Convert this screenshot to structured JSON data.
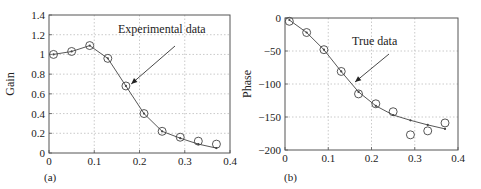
{
  "chart_data": [
    {
      "type": "line",
      "panel_label": "(a)",
      "title": "",
      "xlabel": "",
      "ylabel": "Gain",
      "xlim": [
        0,
        0.4
      ],
      "ylim": [
        0,
        1.4
      ],
      "x_ticks": [
        "0",
        "0.1",
        "0.2",
        "0.3",
        "0.4"
      ],
      "y_ticks": [
        "0",
        "0.2",
        "0.4",
        "0.6",
        "0.8",
        "1",
        "1.2",
        "1.4"
      ],
      "grid": true,
      "annotation": {
        "text": "Experimental data",
        "arrow_to": [
          0.175,
          0.68
        ]
      },
      "x": [
        0.01,
        0.05,
        0.09,
        0.13,
        0.17,
        0.21,
        0.25,
        0.29,
        0.33,
        0.37
      ],
      "series": [
        {
          "name": "Experimental data",
          "style": "circles",
          "values": [
            1.0,
            1.03,
            1.09,
            0.96,
            0.68,
            0.4,
            0.22,
            0.16,
            0.12,
            0.09
          ]
        },
        {
          "name": "Model",
          "style": "line",
          "values": [
            1.0,
            1.03,
            1.09,
            0.96,
            0.68,
            0.4,
            0.22,
            0.15,
            0.09,
            0.05
          ]
        }
      ]
    },
    {
      "type": "line",
      "panel_label": "(b)",
      "title": "",
      "xlabel": "",
      "ylabel": "Phase",
      "xlim": [
        0,
        0.4
      ],
      "ylim": [
        -200,
        0
      ],
      "x_ticks": [
        "0",
        "0.1",
        "0.2",
        "0.3",
        "0.4"
      ],
      "y_ticks": [
        "0",
        "-50",
        "-100",
        "-150",
        "-200"
      ],
      "grid": true,
      "annotation": {
        "text": "True data",
        "arrow_to": [
          0.155,
          -100
        ]
      },
      "x": [
        0.01,
        0.05,
        0.09,
        0.13,
        0.17,
        0.21,
        0.25,
        0.29,
        0.33,
        0.37
      ],
      "series": [
        {
          "name": "Measured",
          "style": "circles",
          "values": [
            -5,
            -22,
            -48,
            -81,
            -115,
            -130,
            -142,
            -177,
            -171,
            -159
          ]
        },
        {
          "name": "True data",
          "style": "line",
          "values": [
            -3,
            -22,
            -48,
            -81,
            -112,
            -133,
            -147,
            -155,
            -162,
            -168
          ]
        }
      ]
    }
  ]
}
